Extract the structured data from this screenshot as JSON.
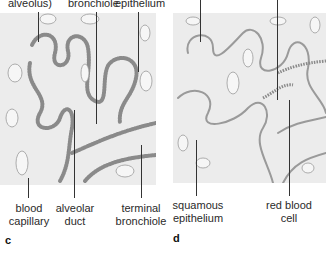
{
  "figure": {
    "panels": [
      {
        "letter": "c",
        "top_labels": [
          "alveolus)",
          "bronchiole",
          "epithelium"
        ],
        "bottom_labels": [
          {
            "line1": "blood",
            "line2": "capillary"
          },
          {
            "line1": "alveolar",
            "line2": "duct"
          },
          {
            "line1": "terminal",
            "line2": "bronchiole"
          }
        ]
      },
      {
        "letter": "d",
        "top_labels": [],
        "bottom_labels": [
          {
            "line1": "squamous",
            "line2": "epithelium"
          },
          {
            "line1": "red blood",
            "line2": "cell"
          }
        ]
      }
    ],
    "colors": {
      "panel_bg": "#ececec",
      "tissue_stroke": "#8a8a8a",
      "leader_line": "#333333"
    }
  }
}
